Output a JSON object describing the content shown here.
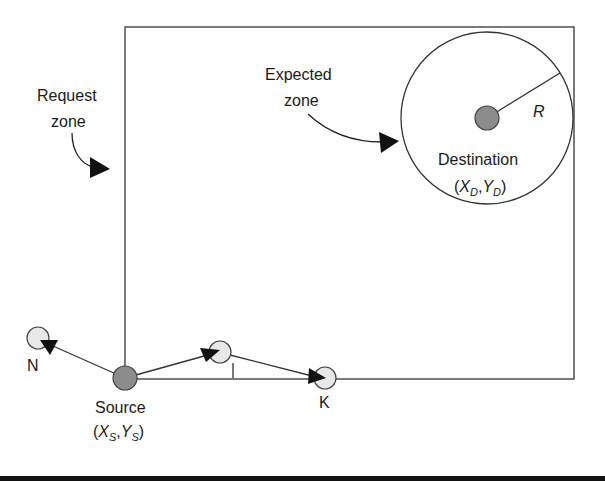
{
  "diagram": {
    "type": "routing-zone-diagram",
    "colors": {
      "stroke": "#333333",
      "node_fill": "#e8e8e8",
      "endpoint_fill": "#8c8c8c",
      "arrowhead": "#111111",
      "bottom_bar": "#111111"
    },
    "labels": {
      "request_zone_line1": "Request",
      "request_zone_line2": "zone",
      "expected_zone_line1": "Expected",
      "expected_zone_line2": "zone",
      "radius": "R",
      "destination": "Destination",
      "destination_coord_x": "X",
      "destination_coord_x_sub": "D",
      "destination_coord_y": "Y",
      "destination_coord_y_sub": "D",
      "source": "Source",
      "source_coord_x": "X",
      "source_coord_x_sub": "S",
      "source_coord_y": "Y",
      "source_coord_y_sub": "S",
      "open_paren": "(",
      "comma": ",",
      "close_paren": ")",
      "node_n": "N",
      "node_i": "I",
      "node_k": "K"
    },
    "nodes": [
      {
        "id": "Source",
        "role": "source",
        "x": 125,
        "y": 378
      },
      {
        "id": "Destination",
        "role": "destination",
        "x": 487,
        "y": 118
      },
      {
        "id": "N",
        "role": "neighbor",
        "x": 38,
        "y": 338
      },
      {
        "id": "I",
        "role": "neighbor",
        "x": 220,
        "y": 352
      },
      {
        "id": "K",
        "role": "neighbor",
        "x": 325,
        "y": 378
      }
    ],
    "edges": [
      {
        "from": "Source",
        "to": "N",
        "arrow": true
      },
      {
        "from": "Source",
        "to": "I",
        "arrow": true
      },
      {
        "from": "I",
        "to": "K",
        "arrow": true
      }
    ],
    "zones": {
      "request_zone": {
        "x1": 125,
        "y1": 27,
        "x2": 574,
        "y2": 379
      },
      "expected_zone": {
        "cx": 487,
        "cy": 118,
        "r": 86
      }
    }
  }
}
